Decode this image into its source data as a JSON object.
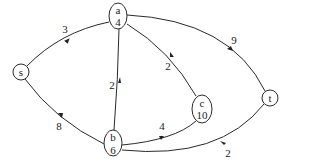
{
  "diagram": {
    "type": "directed-graph",
    "nodes": [
      {
        "id": "s",
        "label": "s",
        "value": ""
      },
      {
        "id": "a",
        "label": "a",
        "value": "4"
      },
      {
        "id": "b",
        "label": "b",
        "value": "6"
      },
      {
        "id": "c",
        "label": "c",
        "value": "10"
      },
      {
        "id": "t",
        "label": "t",
        "value": ""
      }
    ],
    "edges": [
      {
        "from": "s",
        "to": "a",
        "weight": "3"
      },
      {
        "from": "s",
        "to": "b",
        "weight": "8"
      },
      {
        "from": "b",
        "to": "a",
        "weight": "2"
      },
      {
        "from": "c",
        "to": "a",
        "weight": "2"
      },
      {
        "from": "a",
        "to": "t",
        "weight": "9"
      },
      {
        "from": "b",
        "to": "c",
        "weight": "4"
      },
      {
        "from": "b",
        "to": "t",
        "weight": "2"
      }
    ]
  }
}
